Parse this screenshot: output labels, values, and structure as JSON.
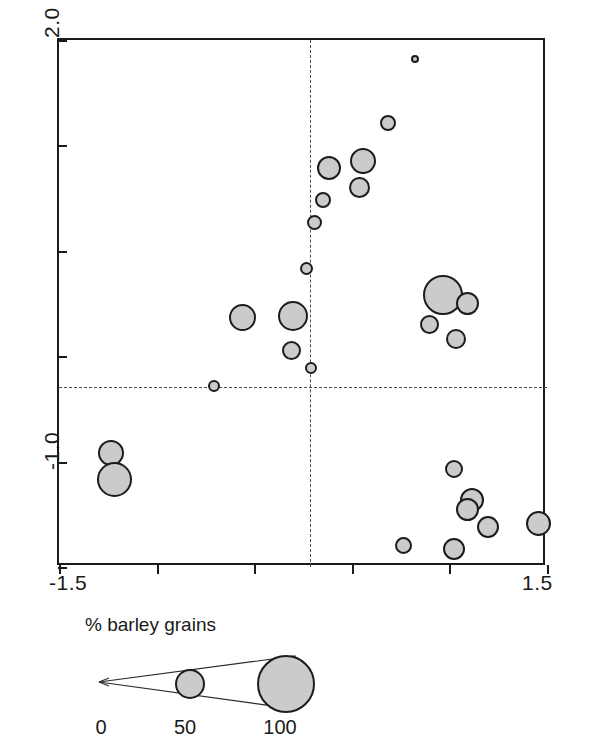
{
  "chart_data": {
    "type": "scatter",
    "title": "",
    "xlabel": "",
    "ylabel": "",
    "xlim": [
      -1.5,
      1.5
    ],
    "ylim": [
      -1.0,
      2.0
    ],
    "grid": false,
    "legend_position": "below-plot",
    "reference_lines": {
      "vertical_x": 0.0,
      "horizontal_y": 0.0,
      "style": "dashed"
    },
    "size_encoding": "% barley grains",
    "x_ticks": [
      -1.5,
      -0.9,
      -0.3,
      0.3,
      0.9,
      1.5
    ],
    "y_ticks": [
      2.0,
      1.4,
      0.8,
      0.2,
      -0.4,
      -1.0
    ],
    "x_tick_labels": [
      "-1.5",
      "",
      "",
      "",
      "",
      "1.5"
    ],
    "y_tick_labels": [
      "2.0",
      "",
      "",
      "",
      "",
      "-1.0"
    ],
    "points": [
      {
        "x": 0.69,
        "y": 1.89,
        "size": 8
      },
      {
        "x": 0.52,
        "y": 1.53,
        "size": 16
      },
      {
        "x": 0.37,
        "y": 1.31,
        "size": 26
      },
      {
        "x": 0.16,
        "y": 1.27,
        "size": 24
      },
      {
        "x": 0.35,
        "y": 1.16,
        "size": 21
      },
      {
        "x": 0.12,
        "y": 1.09,
        "size": 16
      },
      {
        "x": 0.07,
        "y": 0.96,
        "size": 15
      },
      {
        "x": 0.02,
        "y": 0.7,
        "size": 13
      },
      {
        "x": -0.37,
        "y": 0.42,
        "size": 27
      },
      {
        "x": -0.06,
        "y": 0.43,
        "size": 30
      },
      {
        "x": 0.86,
        "y": 0.55,
        "size": 40
      },
      {
        "x": 1.01,
        "y": 0.5,
        "size": 23
      },
      {
        "x": 0.78,
        "y": 0.38,
        "size": 19
      },
      {
        "x": 0.94,
        "y": 0.3,
        "size": 20
      },
      {
        "x": -0.07,
        "y": 0.23,
        "size": 19
      },
      {
        "x": 0.05,
        "y": 0.13,
        "size": 12
      },
      {
        "x": -0.55,
        "y": 0.03,
        "size": 12
      },
      {
        "x": -1.18,
        "y": -0.35,
        "size": 26
      },
      {
        "x": -1.16,
        "y": -0.5,
        "size": 35
      },
      {
        "x": 0.93,
        "y": -0.44,
        "size": 18
      },
      {
        "x": 1.04,
        "y": -0.62,
        "size": 24
      },
      {
        "x": 1.01,
        "y": -0.67,
        "size": 23
      },
      {
        "x": 1.14,
        "y": -0.77,
        "size": 22
      },
      {
        "x": 1.45,
        "y": -0.75,
        "size": 25
      },
      {
        "x": 0.62,
        "y": -0.88,
        "size": 17
      },
      {
        "x": 0.93,
        "y": -0.9,
        "size": 22
      }
    ]
  },
  "plot": {
    "y_axis_top_label": "2.0",
    "y_axis_bottom_label": "-1.0",
    "x_axis_left_label": "-1.5",
    "x_axis_right_label": "1.5"
  },
  "legend": {
    "title": "% barley grains",
    "scale_labels": [
      "0",
      "50",
      "100"
    ],
    "bubble_values": [
      50,
      100
    ]
  }
}
